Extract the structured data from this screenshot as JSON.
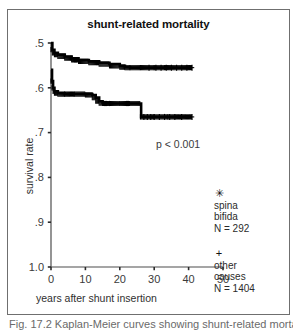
{
  "figure": {
    "title": "shunt-related mortality",
    "caption": "Fig. 17.2  Kaplan-Meier curves showing shunt-related mortality",
    "annotation": "p < 0.001"
  },
  "axes": {
    "x_label": "years after shunt insertion",
    "y_label": "survival rate",
    "x_ticks": [
      "0",
      "10",
      "20",
      "30",
      "40",
      "50"
    ],
    "y_ticks": [
      "1.0",
      ".9",
      ".8",
      ".7",
      ".6",
      ".5"
    ]
  },
  "legend": {
    "position": "right",
    "entries": [
      {
        "marker": "✳",
        "marker_name": "asterisk-marker",
        "name": "spina bifida",
        "line1": "spina",
        "line2": "bifida",
        "n_label": "N = 292",
        "n": 292
      },
      {
        "marker": "+",
        "marker_name": "plus-marker",
        "name": "other causes",
        "line1": "other",
        "line2": "causes",
        "n_label": "N = 1404",
        "n": 1404
      }
    ]
  },
  "colors": {
    "curve": "#000000",
    "axis": "#4d4d4d",
    "text": "#2b2b2b",
    "frame": "#6f6f6f"
  },
  "chart_data": {
    "type": "line",
    "title": "shunt-related mortality",
    "subtitle": "",
    "xlabel": "years after shunt insertion",
    "ylabel": "survival rate",
    "xlim": [
      0,
      50
    ],
    "ylim": [
      0.5,
      1.0
    ],
    "xticks": [
      0,
      10,
      20,
      30,
      40,
      50
    ],
    "yticks": [
      0.5,
      0.6,
      0.7,
      0.8,
      0.9,
      1.0
    ],
    "grid": false,
    "legend_position": "right",
    "annotations": [
      {
        "text": "p < 0.001",
        "x": 22,
        "y": 0.78
      }
    ],
    "series": [
      {
        "name": "other causes",
        "marker": "+",
        "n": 1404,
        "step": true,
        "x": [
          0,
          0.4,
          1,
          2,
          4,
          6,
          8,
          11,
          14,
          17,
          20,
          21.5,
          23,
          26,
          30,
          33,
          41
        ],
        "y": [
          1.0,
          0.985,
          0.978,
          0.974,
          0.97,
          0.966,
          0.962,
          0.959,
          0.956,
          0.953,
          0.949,
          0.946,
          0.945,
          0.945,
          0.945,
          0.945,
          0.945
        ],
        "censored_x": [
          28.5,
          30.5,
          32,
          33.5,
          35,
          36.5,
          38,
          39.5,
          41
        ],
        "censored_y": [
          0.945,
          0.945,
          0.945,
          0.945,
          0.945,
          0.945,
          0.945,
          0.945,
          0.945
        ]
      },
      {
        "name": "spina bifida",
        "marker": "*",
        "n": 292,
        "step": true,
        "x": [
          0,
          0.3,
          0.6,
          1,
          2,
          4,
          7,
          10,
          12,
          13,
          14,
          15,
          17,
          20,
          23,
          26,
          26.2,
          30,
          34,
          38,
          41
        ],
        "y": [
          0.94,
          0.915,
          0.9,
          0.892,
          0.888,
          0.886,
          0.886,
          0.886,
          0.884,
          0.878,
          0.87,
          0.866,
          0.865,
          0.865,
          0.865,
          0.865,
          0.835,
          0.835,
          0.835,
          0.835,
          0.835
        ],
        "censored_x": [
          27,
          28,
          29,
          30,
          31.5,
          33,
          34.5,
          36,
          38,
          41
        ],
        "censored_y": [
          0.835,
          0.835,
          0.835,
          0.835,
          0.835,
          0.835,
          0.835,
          0.835,
          0.835,
          0.835
        ]
      }
    ]
  }
}
